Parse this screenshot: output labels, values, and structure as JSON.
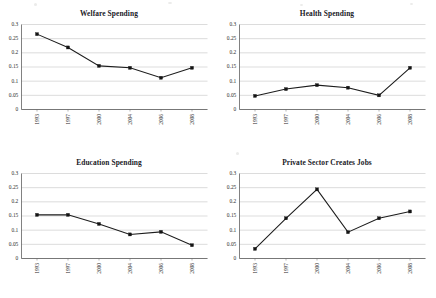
{
  "page": {
    "title": "Four-panel spending and jobs line charts",
    "background_color": "#ffffff",
    "marker_color": "#141414",
    "line_color": "#1c1c1c",
    "gridline_color": "#b9b9b9",
    "axis_color": "#4a4a4a"
  },
  "chart_data": [
    {
      "type": "line",
      "title": "Welfare Spending",
      "categories": [
        "1993",
        "1997",
        "2000",
        "2004",
        "2006",
        "2008"
      ],
      "values": [
        0.266,
        0.219,
        0.154,
        0.147,
        0.112,
        0.147
      ],
      "xlabel": "",
      "ylabel": "",
      "ylim": [
        0,
        0.3
      ],
      "yticks": [
        "0",
        "0.05",
        "0.1",
        "0.15",
        "0.2",
        "0.25",
        "0.3"
      ],
      "grid": true,
      "legend": "none",
      "marker": "square"
    },
    {
      "type": "line",
      "title": "Health Spending",
      "categories": [
        "1993",
        "1997",
        "2000",
        "2004",
        "2006",
        "2008"
      ],
      "values": [
        0.048,
        0.072,
        0.086,
        0.077,
        0.05,
        0.147
      ],
      "xlabel": "",
      "ylabel": "",
      "ylim": [
        0,
        0.3
      ],
      "yticks": [
        "0",
        "0.05",
        "0.1",
        "0.15",
        "0.2",
        "0.25",
        "0.3"
      ],
      "grid": true,
      "legend": "none",
      "marker": "square"
    },
    {
      "type": "line",
      "title": "Education Spending",
      "categories": [
        "1993",
        "1997",
        "2000",
        "2004",
        "2006",
        "2008"
      ],
      "values": [
        0.154,
        0.154,
        0.122,
        0.085,
        0.094,
        0.047
      ],
      "xlabel": "",
      "ylabel": "",
      "ylim": [
        0,
        0.3
      ],
      "yticks": [
        "0",
        "0.05",
        "0.1",
        "0.15",
        "0.2",
        "0.25",
        "0.3"
      ],
      "grid": true,
      "legend": "none",
      "marker": "square"
    },
    {
      "type": "line",
      "title": "Private Sector Creates Jobs",
      "categories": [
        "1993",
        "1997",
        "2000",
        "2004",
        "2006",
        "2008"
      ],
      "values": [
        0.034,
        0.142,
        0.244,
        0.093,
        0.142,
        0.166
      ],
      "xlabel": "",
      "ylabel": "",
      "ylim": [
        0,
        0.3
      ],
      "yticks": [
        "0",
        "0.05",
        "0.1",
        "0.15",
        "0.2",
        "0.25",
        "0.3"
      ],
      "grid": true,
      "legend": "none",
      "marker": "square"
    }
  ]
}
